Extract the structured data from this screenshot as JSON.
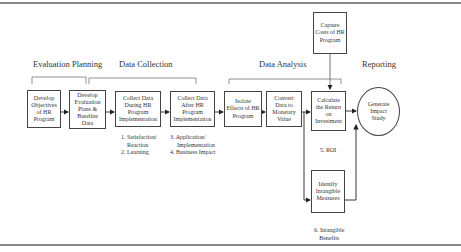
{
  "sections": [
    {
      "label": "Evaluation Planning"
    },
    {
      "label": "Data Collection"
    },
    {
      "label": "Data Analysis"
    },
    {
      "label": "Reporting"
    }
  ],
  "steps": [
    {
      "label": "Develop Objectives of HR Program"
    },
    {
      "label": "Develop Evaluation Plans & Baseline Data"
    },
    {
      "label": "Collect Data During HR Program Implementation"
    },
    {
      "label": "Collect Data After HR Program Implementation"
    },
    {
      "label": "Isolate Effects of HR Program"
    },
    {
      "label": "Convert Data to Monetary Value"
    },
    {
      "label": "Calculate the Return on Investment"
    },
    {
      "label": "Generate Impact Study"
    }
  ],
  "side_steps": {
    "capture_costs": "Capture Costs of HR Program",
    "intangible": "Identify Intangible Measures"
  },
  "notes": {
    "during": [
      "1. Satisfaction/",
      "Reaction",
      "2. Learning"
    ],
    "after": [
      "3. Application/",
      "Implementation",
      "4. Business Impact"
    ],
    "roi": "5. ROI",
    "intangible": [
      "6. Intangible",
      "Benefits"
    ]
  },
  "colors": {
    "line": "#444444",
    "frame": "#8a8a8a",
    "bracket": "#777777"
  }
}
